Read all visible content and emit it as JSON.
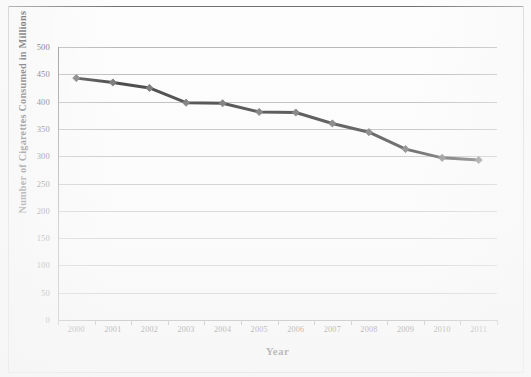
{
  "figure": {
    "background_color": "#fdfdfd",
    "frame_color": "#6f6f6f",
    "gridline_color": "#b0b0b0",
    "axis_color": "#7c7c7c"
  },
  "chart_data": {
    "type": "line",
    "title": "",
    "xlabel": "Year",
    "ylabel": "Number of Cigarettes Consumed in Millions",
    "categories": [
      "2000",
      "2001",
      "2002",
      "2003",
      "2004",
      "2005",
      "2006",
      "2007",
      "2008",
      "2009",
      "2010",
      "2011"
    ],
    "values": [
      443,
      435,
      425,
      398,
      397,
      381,
      380,
      360,
      344,
      313,
      297,
      293
    ],
    "series": [
      {
        "name": "Cigarettes consumed",
        "values": [
          443,
          435,
          425,
          398,
          397,
          381,
          380,
          360,
          344,
          313,
          297,
          293
        ],
        "line_color": "#1c1c1c",
        "marker_color": "#595959",
        "marker_shape": "diamond"
      }
    ],
    "ylim": [
      0,
      500
    ],
    "ytick_step": 50,
    "yticks": [
      "500",
      "450",
      "400",
      "350",
      "300",
      "250",
      "200",
      "150",
      "100",
      "50",
      "0"
    ],
    "grid": true,
    "grid_axis": "y",
    "legend": false,
    "legend_position": "none"
  }
}
